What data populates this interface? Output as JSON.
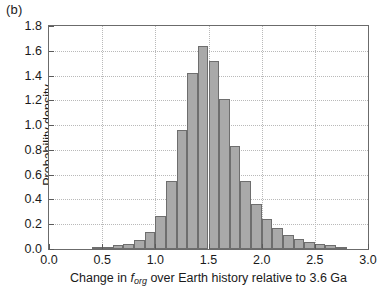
{
  "panel": {
    "label": "(b)"
  },
  "axes": {
    "ylabel": "Probability density",
    "xlabel_pre": "Change in ",
    "xlabel_var": "f",
    "xlabel_sub": "org",
    "xlabel_post": " over Earth history relative to 3.6 Ga",
    "xlabel_full": "Change in f_org over Earth history relative to 3.6 Ga"
  },
  "style": {
    "bar_fill": "#a9a9a9",
    "bar_edge": "#6e6e6e",
    "axis_color": "#6b6b6b",
    "grid_color": "#b9b9b9",
    "text_color": "#1a1a1a"
  },
  "chart_data": {
    "type": "bar",
    "title": "",
    "subtitle": "",
    "xlabel": "Change in f_org over Earth history relative to 3.6 Ga",
    "ylabel": "Probability density",
    "xlim": [
      0.0,
      3.0
    ],
    "ylim": [
      0.0,
      1.8
    ],
    "xticks": [
      0.0,
      0.5,
      1.0,
      1.5,
      2.0,
      2.5,
      3.0
    ],
    "xticklabels": [
      "0.0",
      "0.5",
      "1.0",
      "1.5",
      "2.0",
      "2.5",
      "3.0"
    ],
    "yticks": [
      0.0,
      0.2,
      0.4,
      0.6,
      0.8,
      1.0,
      1.2,
      1.4,
      1.6,
      1.8
    ],
    "yticklabels": [
      "0.0",
      "0.2",
      "0.4",
      "0.6",
      "0.8",
      "1.0",
      "1.2",
      "1.4",
      "1.6",
      "1.8"
    ],
    "grid": true,
    "grid_style": "dotted",
    "legend": "none",
    "bin_width": 0.1,
    "bin_edges": [
      0.4,
      0.5,
      0.6,
      0.7,
      0.8,
      0.9,
      1.0,
      1.1,
      1.2,
      1.3,
      1.4,
      1.5,
      1.6,
      1.7,
      1.8,
      1.9,
      2.0,
      2.1,
      2.2,
      2.3,
      2.4,
      2.5,
      2.6,
      2.7,
      2.8
    ],
    "bin_centers": [
      0.45,
      0.55,
      0.65,
      0.75,
      0.85,
      0.95,
      1.05,
      1.15,
      1.25,
      1.35,
      1.45,
      1.55,
      1.65,
      1.75,
      1.85,
      1.95,
      2.05,
      2.15,
      2.25,
      2.35,
      2.45,
      2.55,
      2.65,
      2.75
    ],
    "values": [
      0.01,
      0.02,
      0.03,
      0.04,
      0.07,
      0.14,
      0.27,
      0.55,
      0.96,
      1.42,
      1.64,
      1.52,
      1.21,
      0.83,
      0.55,
      0.36,
      0.24,
      0.17,
      0.11,
      0.08,
      0.06,
      0.04,
      0.03,
      0.02
    ],
    "categories": [
      "0.40-0.50",
      "0.50-0.60",
      "0.60-0.70",
      "0.70-0.80",
      "0.80-0.90",
      "0.90-1.00",
      "1.00-1.10",
      "1.10-1.20",
      "1.20-1.30",
      "1.30-1.40",
      "1.40-1.50",
      "1.50-1.60",
      "1.60-1.70",
      "1.70-1.80",
      "1.80-1.90",
      "1.90-2.00",
      "2.00-2.10",
      "2.10-2.20",
      "2.20-2.30",
      "2.30-2.40",
      "2.40-2.50",
      "2.50-2.60",
      "2.60-2.70",
      "2.70-2.80"
    ],
    "peak_value": 1.64,
    "peak_bin": "1.30-1.40"
  }
}
